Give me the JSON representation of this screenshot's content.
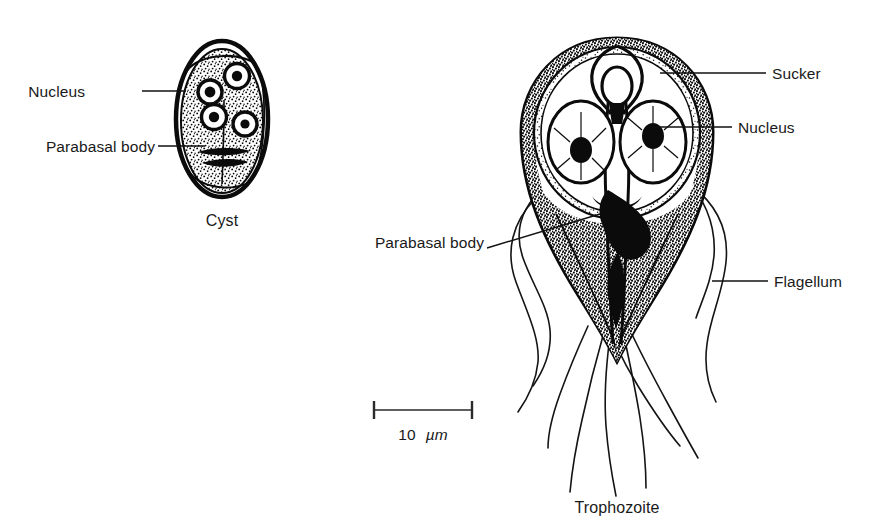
{
  "figure": {
    "title_visible": false,
    "background_color": "#ffffff",
    "ink_color": "#0b0b0b",
    "text_color": "#1a1a1a"
  },
  "cyst": {
    "caption": "Cyst",
    "labels": [
      {
        "id": "cyst-nucleus",
        "text": "Nucleus"
      },
      {
        "id": "cyst-parabasal-body",
        "text": "Parabasal body"
      }
    ],
    "nuclei_count": 4
  },
  "trophozoite": {
    "caption": "Trophozoite",
    "labels": [
      {
        "id": "troph-sucker",
        "text": "Sucker"
      },
      {
        "id": "troph-nucleus",
        "text": "Nucleus"
      },
      {
        "id": "troph-flagellum",
        "text": "Flagellum"
      },
      {
        "id": "troph-parabasal-body",
        "text": "Parabasal body"
      }
    ],
    "nuclei_count": 2,
    "flagella_count": 8
  },
  "scale_bar": {
    "value": "10",
    "unit": "µm",
    "length_px": 100
  }
}
